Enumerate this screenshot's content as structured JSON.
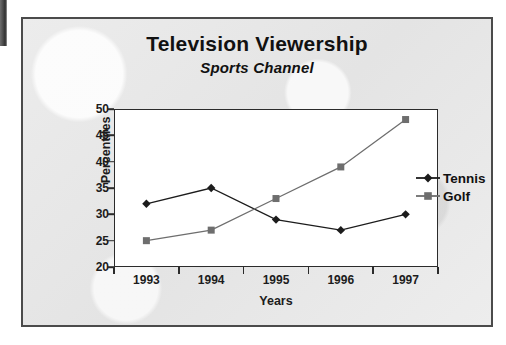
{
  "figure": {
    "title": "Television Viewership",
    "subtitle": "Sports Channel"
  },
  "chart_data": {
    "type": "line",
    "title": "Television Viewership",
    "subtitle": "Sports Channel",
    "xlabel": "Years",
    "ylabel": "Percentiles",
    "categories": [
      "1993",
      "1994",
      "1995",
      "1996",
      "1997"
    ],
    "ylim": [
      20,
      50
    ],
    "yticks": [
      20,
      25,
      30,
      35,
      40,
      45,
      50
    ],
    "grid": false,
    "legend_position": "right",
    "series": [
      {
        "name": "Tennis",
        "values": [
          32,
          35,
          29,
          27,
          30
        ],
        "color": "#1c1c1c",
        "marker": "diamond"
      },
      {
        "name": "Golf",
        "values": [
          25,
          27,
          33,
          39,
          48
        ],
        "color": "#6e6e6e",
        "marker": "square"
      }
    ]
  },
  "legend": {
    "items": [
      {
        "label": "Tennis",
        "marker": "diamond-marker-icon"
      },
      {
        "label": "Golf",
        "marker": "square-marker-icon"
      }
    ]
  },
  "colors": {
    "background": "#e9e9e9",
    "frame": "#4b4b4b",
    "plot_background": "#ffffff",
    "axis": "#2b2b2b",
    "tennis": "#1c1c1c",
    "golf": "#6e6e6e",
    "text": "#111111"
  }
}
